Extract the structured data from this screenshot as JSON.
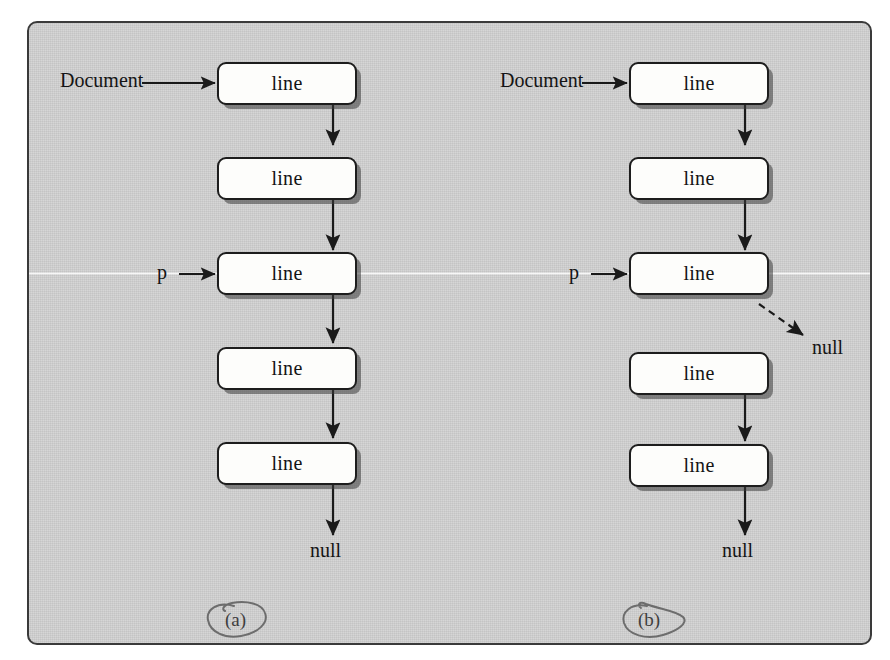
{
  "figure": {
    "background_color": "#cccccc",
    "frame_color": "#3a3a3a",
    "node_fill": "#fdfdfb",
    "node_stroke": "#1d1d1d",
    "arrow_color": "#1a1a1a"
  },
  "panels": [
    {
      "tag": "(a)",
      "tag_annotation": "hand-drawn-circle",
      "head_label": "Document",
      "pointer_label": "p",
      "terminator_label": "null",
      "nodes": [
        {
          "label": "line"
        },
        {
          "label": "line"
        },
        {
          "label": "line"
        },
        {
          "label": "line"
        },
        {
          "label": "line"
        }
      ],
      "links": [
        {
          "from": 0,
          "to": 1,
          "style": "solid"
        },
        {
          "from": 1,
          "to": 2,
          "style": "solid"
        },
        {
          "from": 2,
          "to": 3,
          "style": "solid"
        },
        {
          "from": 3,
          "to": 4,
          "style": "solid"
        },
        {
          "from": 4,
          "to": "null",
          "style": "solid"
        }
      ]
    },
    {
      "tag": "(b)",
      "tag_annotation": "hand-drawn-circle",
      "head_label": "Document",
      "pointer_label": "p",
      "terminator_label": "null",
      "dangling_label": "null",
      "nodes": [
        {
          "label": "line"
        },
        {
          "label": "line"
        },
        {
          "label": "line"
        },
        {
          "label": "line"
        },
        {
          "label": "line"
        }
      ],
      "links": [
        {
          "from": 0,
          "to": 1,
          "style": "solid"
        },
        {
          "from": 1,
          "to": 2,
          "style": "solid"
        },
        {
          "from": 2,
          "to": "null",
          "style": "dashed"
        },
        {
          "from": 3,
          "to": 4,
          "style": "solid"
        },
        {
          "from": 4,
          "to": "null",
          "style": "solid"
        }
      ]
    }
  ]
}
